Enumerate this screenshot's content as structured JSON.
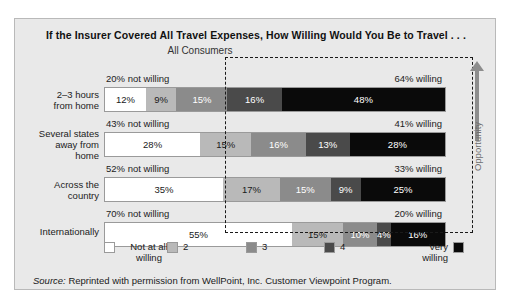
{
  "figure": {
    "title": "If the Insurer Covered All Travel Expenses, How Willing Would You Be to Travel . . .",
    "subtitle": "All Consumers",
    "source_prefix": "Source:",
    "source_text": " Reprinted with permission from WellPoint, Inc. Customer Viewpoint Program.",
    "annotation_label": "Opportunity"
  },
  "legend": {
    "items": [
      {
        "label": "Not at all\nwilling",
        "color": "#ffffff"
      },
      {
        "label": "2",
        "color": "#b9b9b9"
      },
      {
        "label": "3",
        "color": "#8b8b8b"
      },
      {
        "label": "4",
        "color": "#4a4a4a"
      },
      {
        "label": "Very\nwilling",
        "color": "#0a0a0a"
      }
    ]
  },
  "rows": [
    {
      "label": "2–3 hours\nfrom home",
      "not_willing": "20% not willing",
      "willing": "64% willing",
      "segments": [
        {
          "value": 12,
          "text": "12%"
        },
        {
          "value": 9,
          "text": "9%"
        },
        {
          "value": 15,
          "text": "15%"
        },
        {
          "value": 16,
          "text": "16%"
        },
        {
          "value": 48,
          "text": "48%"
        }
      ]
    },
    {
      "label": "Several states\naway from\nhome",
      "not_willing": "43% not willing",
      "willing": "41% willing",
      "segments": [
        {
          "value": 28,
          "text": "28%"
        },
        {
          "value": 15,
          "text": "15%"
        },
        {
          "value": 16,
          "text": "16%"
        },
        {
          "value": 13,
          "text": "13%"
        },
        {
          "value": 28,
          "text": "28%"
        }
      ]
    },
    {
      "label": "Across the\ncountry",
      "not_willing": "52% not willing",
      "willing": "33% willing",
      "segments": [
        {
          "value": 35,
          "text": "35%"
        },
        {
          "value": 17,
          "text": "17%"
        },
        {
          "value": 15,
          "text": "15%"
        },
        {
          "value": 9,
          "text": "9%"
        },
        {
          "value": 25,
          "text": "25%"
        }
      ]
    },
    {
      "label": "Internationally",
      "not_willing": "70% not willing",
      "willing": "20% willing",
      "segments": [
        {
          "value": 55,
          "text": "55%"
        },
        {
          "value": 15,
          "text": "15%"
        },
        {
          "value": 10,
          "text": "10%"
        },
        {
          "value": 4,
          "text": "4%"
        },
        {
          "value": 16,
          "text": "16%"
        }
      ]
    }
  ],
  "chart_data": {
    "type": "bar",
    "title": "If the Insurer Covered All Travel Expenses, How Willing Would You Be to Travel . . .",
    "subtitle": "All Consumers",
    "orientation": "horizontal",
    "stacked": true,
    "stacked_100pct": true,
    "xlabel": "",
    "ylabel": "",
    "xlim": [
      0,
      100
    ],
    "grid": false,
    "legend_position": "bottom",
    "categories": [
      "2–3 hours from home",
      "Several states away from home",
      "Across the country",
      "Internationally"
    ],
    "series": [
      {
        "name": "Not at all willing",
        "color": "#ffffff",
        "values": [
          12,
          28,
          35,
          55
        ]
      },
      {
        "name": "2",
        "color": "#b9b9b9",
        "values": [
          9,
          15,
          17,
          15
        ]
      },
      {
        "name": "3",
        "color": "#8b8b8b",
        "values": [
          15,
          16,
          15,
          10
        ]
      },
      {
        "name": "4",
        "color": "#4a4a4a",
        "values": [
          16,
          13,
          9,
          4
        ]
      },
      {
        "name": "Very willing",
        "color": "#0a0a0a",
        "values": [
          48,
          28,
          25,
          16
        ]
      }
    ],
    "annotations": [
      {
        "category": "2–3 hours from home",
        "left": "20% not willing",
        "right": "64% willing"
      },
      {
        "category": "Several states away from home",
        "left": "43% not willing",
        "right": "41% willing"
      },
      {
        "category": "Across the country",
        "left": "52% not willing",
        "right": "33% willing"
      },
      {
        "category": "Internationally",
        "left": "70% not willing",
        "right": "20% willing"
      },
      {
        "type": "callout-box",
        "text": "Opportunity",
        "covers": "segments 4 and Very willing"
      }
    ],
    "source": "Reprinted with permission from WellPoint, Inc. Customer Viewpoint Program."
  }
}
